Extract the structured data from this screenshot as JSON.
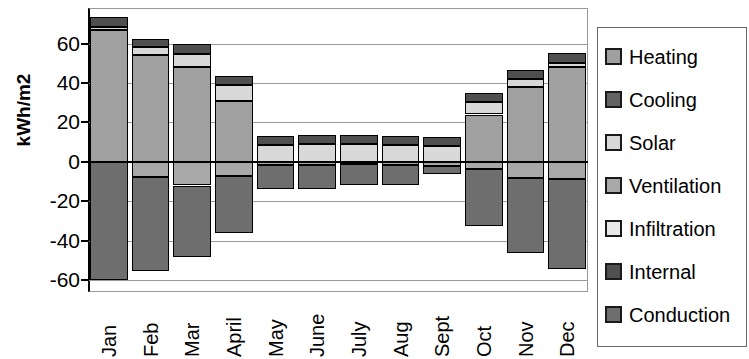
{
  "chart_data": {
    "type": "bar",
    "subtype": "stacked-bar-diverging",
    "title": "",
    "xlabel": "",
    "ylabel": "kWh/m2",
    "ylim": [
      -66,
      78
    ],
    "yticks": [
      60,
      40,
      20,
      0,
      -20,
      -40,
      -60
    ],
    "ytick_labels": [
      "60",
      "40",
      "20",
      "0",
      "-20",
      "-40",
      "-60"
    ],
    "grid": true,
    "legend_position": "right",
    "categories": [
      "Jan",
      "Feb",
      "Mar",
      "April",
      "May",
      "June",
      "July",
      "Aug",
      "Sept",
      "Oct",
      "Nov",
      "Dec"
    ],
    "series": [
      {
        "name": "Heating",
        "color": "#a0a0a0",
        "values": [
          67.0,
          54.0,
          48.0,
          31.0,
          0.0,
          0.0,
          0.0,
          0.0,
          0.0,
          24.0,
          38.0,
          48.0
        ]
      },
      {
        "name": "Cooling",
        "color": "#636363",
        "values": [
          0.0,
          0.0,
          0.0,
          0.0,
          0.0,
          0.0,
          0.0,
          0.0,
          0.0,
          0.0,
          0.0,
          0.0
        ]
      },
      {
        "name": "Solar",
        "color": "#d8d8d8",
        "values": [
          1.5,
          4.0,
          6.5,
          8.0,
          8.5,
          9.0,
          9.0,
          8.5,
          8.0,
          6.5,
          4.0,
          2.0
        ]
      },
      {
        "name": "Ventilation",
        "color": "#a8a8a8",
        "values": [
          0.0,
          -7.5,
          -12.0,
          -7.0,
          -1.5,
          -1.5,
          -1.0,
          -1.5,
          -2.0,
          -3.5,
          -8.0,
          -8.5
        ]
      },
      {
        "name": "Infiltration",
        "color": "#e8e8e8",
        "values": [
          0.0,
          0.0,
          0.0,
          0.0,
          0.0,
          0.0,
          0.0,
          0.0,
          0.0,
          0.0,
          0.0,
          0.0
        ]
      },
      {
        "name": "Internal",
        "color": "#4f4f4f",
        "values": [
          5.0,
          4.5,
          5.0,
          4.5,
          4.5,
          4.5,
          4.5,
          4.5,
          4.5,
          4.5,
          4.5,
          5.0
        ]
      },
      {
        "name": "Conduction",
        "color": "#6e6e6e",
        "values": [
          -60.0,
          -48.0,
          -36.0,
          -29.0,
          -12.5,
          -12.5,
          -11.0,
          -10.5,
          -4.0,
          -29.0,
          -38.0,
          -46.0
        ]
      }
    ],
    "totals_positive": [
      73.5,
      62.5,
      59.5,
      43.5,
      13.0,
      13.5,
      13.5,
      13.0,
      12.5,
      35.0,
      46.5,
      55.0
    ],
    "totals_negative": [
      -60.0,
      -55.5,
      -48.0,
      -36.0,
      -14.0,
      -14.0,
      -12.0,
      -12.0,
      -6.0,
      -32.5,
      -46.0,
      -54.5
    ]
  },
  "axes": {
    "ylabel": "kWh/m2",
    "ytick_labels": [
      "60",
      "40",
      "20",
      "0",
      "-20",
      "-40",
      "-60"
    ],
    "xtick_labels": [
      "Jan",
      "Feb",
      "Mar",
      "April",
      "May",
      "June",
      "July",
      "Aug",
      "Sept",
      "Oct",
      "Nov",
      "Dec"
    ]
  },
  "legend": {
    "items": [
      {
        "label": "Heating",
        "color": "#a0a0a0"
      },
      {
        "label": "Cooling",
        "color": "#636363"
      },
      {
        "label": "Solar",
        "color": "#d8d8d8"
      },
      {
        "label": "Ventilation",
        "color": "#a8a8a8"
      },
      {
        "label": "Infiltration",
        "color": "#e8e8e8"
      },
      {
        "label": "Internal",
        "color": "#4f4f4f"
      },
      {
        "label": "Conduction",
        "color": "#6e6e6e"
      }
    ]
  }
}
